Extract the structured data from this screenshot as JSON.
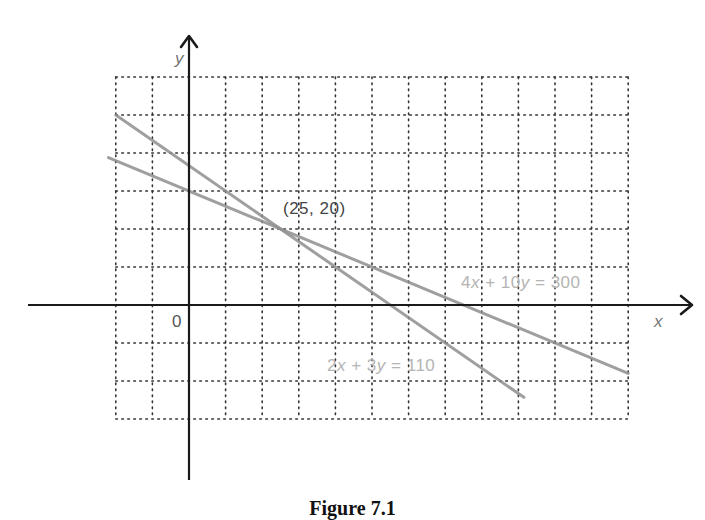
{
  "chart_data": {
    "type": "line",
    "title": "",
    "caption": "Figure 7.1",
    "xlabel": "x",
    "ylabel": "y",
    "origin_label": "0",
    "grid": true,
    "grid_style": "dotted",
    "grid_step": {
      "x": 10,
      "y": 10
    },
    "xlim": [
      -20,
      120
    ],
    "ylim": [
      -30,
      60
    ],
    "series": [
      {
        "name": "2x + 3y = 110",
        "equation": {
          "a": 2,
          "b": 3,
          "c": 110
        },
        "x": [
          -20,
          91.5
        ],
        "y": [
          50,
          -24.3
        ],
        "color": "#8f8f8f"
      },
      {
        "name": "4x + 10y = 300",
        "equation": {
          "a": 4,
          "b": 10,
          "c": 300
        },
        "x": [
          -22,
          120
        ],
        "y": [
          38.8,
          -18
        ],
        "color": "#8f8f8f"
      }
    ],
    "annotations": [
      {
        "text": "(25, 20)",
        "x": 25,
        "y": 20,
        "role": "intersection point"
      },
      {
        "text": "4x + 10y = 300",
        "role": "line label"
      },
      {
        "text": "2x + 3y = 110",
        "role": "line label"
      }
    ]
  },
  "labels": {
    "x_axis": "x",
    "y_axis": "y",
    "origin": "0",
    "intersection": "(25, 20)",
    "eq1": {
      "a": "2",
      "x": "x",
      "op": " + ",
      "b": "3",
      "y": "y",
      "eq": " = ",
      "c": "110"
    },
    "eq2": {
      "a": "4",
      "x": "x",
      "op": " + ",
      "b": "10",
      "y": "y",
      "eq": " = ",
      "c": "300"
    },
    "caption": "Figure 7.1"
  }
}
